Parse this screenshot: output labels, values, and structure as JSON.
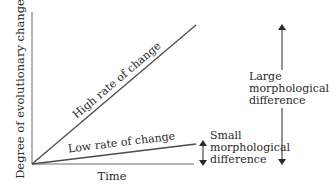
{
  "diagram": {
    "type": "rate-of-change-diagram",
    "axes": {
      "y_label": "Degree of evolutionary change",
      "x_label": "Time"
    },
    "lines": [
      {
        "id": "high",
        "label": "High rate of change"
      },
      {
        "id": "low",
        "label": "Low rate of change"
      }
    ],
    "annotations": {
      "small": {
        "line1": "Small",
        "line2": "morphological",
        "line3": "difference"
      },
      "large": {
        "line1": "Large",
        "line2": "morphological",
        "line3": "difference"
      }
    },
    "colors": {
      "line": "#4a4a4a",
      "text": "#2a2a2a"
    }
  }
}
